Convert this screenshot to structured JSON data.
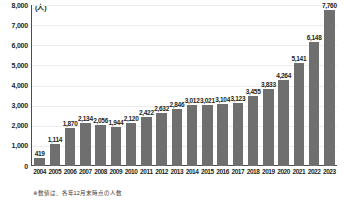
{
  "chart_data": {
    "type": "bar",
    "title": "",
    "subtitle": "",
    "xlabel": "",
    "ylabel": "",
    "unit_label": "(人)",
    "categories": [
      "2004",
      "2005",
      "2006",
      "2007",
      "2008",
      "2009",
      "2010",
      "2011",
      "2012",
      "2013",
      "2014",
      "2015",
      "2016",
      "2017",
      "2018",
      "2019",
      "2020",
      "2021",
      "2022",
      "2023"
    ],
    "values": [
      419,
      1114,
      1870,
      2134,
      2056,
      1944,
      2120,
      2422,
      2632,
      2846,
      3012,
      3021,
      3104,
      3123,
      3455,
      3833,
      4264,
      5141,
      6148,
      7760
    ],
    "value_labels": [
      "419",
      "1,114",
      "1,870",
      "2,134",
      "2,056",
      "1,944",
      "2,120",
      "2,422",
      "2,632",
      "2,846",
      "3,012",
      "3,021",
      "3,104",
      "3,123",
      "3,455",
      "3,833",
      "4,264",
      "5,141",
      "6,148",
      "7,760"
    ],
    "ylim": [
      0,
      8000
    ],
    "ytick_labels": [
      "8,000",
      "7,000",
      "6,000",
      "5,000",
      "4,000",
      "3,000",
      "2,000",
      "1,000",
      "0"
    ],
    "ytick_values": [
      8000,
      7000,
      6000,
      5000,
      4000,
      3000,
      2000,
      1000,
      0
    ],
    "grid": true,
    "legend": null,
    "bar_color": "#6f6f6f",
    "grid_color": "#ededed",
    "axis_color": "#4d4d4d",
    "text_color": "#231f20"
  },
  "footnote": "※数値は、各年12月末時点の人数"
}
